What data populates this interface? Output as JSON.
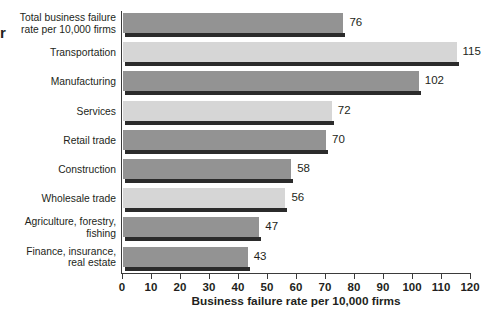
{
  "edge_glyph": "r",
  "chart_data": {
    "type": "bar",
    "orientation": "horizontal",
    "title": "",
    "xlabel": "Business failure rate per 10,000 firms",
    "ylabel": "",
    "xlim": [
      0,
      120
    ],
    "xticks": [
      0,
      10,
      20,
      30,
      40,
      50,
      60,
      70,
      80,
      90,
      100,
      110,
      120
    ],
    "xtick_labels": [
      "0",
      "10",
      "20",
      "30",
      "40",
      "50",
      "60",
      "70",
      "80",
      "90",
      "100",
      "110",
      "120"
    ],
    "grid": false,
    "legend": false,
    "categories": [
      "Total business failure\nrate per 10,000 firms",
      "Transportation",
      "Manufacturing",
      "Services",
      "Retail trade",
      "Construction",
      "Wholesale trade",
      "Agriculture, forestry,\nfishing",
      "Finance, insurance,\nreal estate"
    ],
    "values": [
      76,
      115,
      102,
      72,
      70,
      58,
      56,
      47,
      43
    ],
    "value_labels": [
      "76",
      "115",
      "102",
      "72",
      "70",
      "58",
      "56",
      "47",
      "43"
    ],
    "bar_shades": [
      "dark",
      "light",
      "dark",
      "light",
      "dark",
      "dark",
      "light",
      "dark",
      "dark"
    ],
    "colors": {
      "bar_dark": "#939393",
      "bar_light": "#d6d6d6",
      "bar_shadow": "#2b2b2b",
      "axis": "#3b3b3b",
      "text": "#231f20",
      "background": "#ffffff"
    }
  }
}
